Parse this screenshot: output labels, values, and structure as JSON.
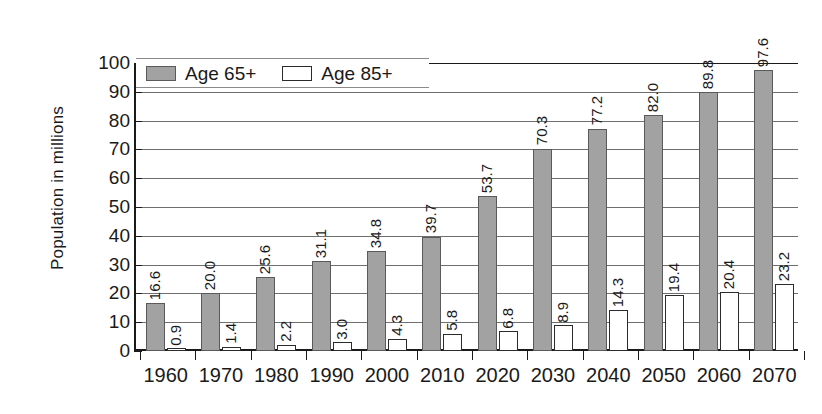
{
  "chart_data": {
    "type": "bar",
    "title": "",
    "subtitle": "",
    "xlabel": "",
    "ylabel": "Population in millions",
    "ylim": [
      0,
      100
    ],
    "yticks": [
      0,
      10,
      20,
      30,
      40,
      50,
      60,
      70,
      80,
      90,
      100
    ],
    "ytick_labels": [
      "0",
      "10",
      "20",
      "30",
      "40",
      "50",
      "60",
      "70",
      "80",
      "90",
      "100"
    ],
    "grid": true,
    "legend_position": "top-left-inside",
    "categories": [
      "1960",
      "1970",
      "1980",
      "1990",
      "2000",
      "2010",
      "2020",
      "2030",
      "2040",
      "2050",
      "2060",
      "2070"
    ],
    "series": [
      {
        "name": "Age 65+",
        "color": "#a2a2a2",
        "edge_color": "#5a5a5a",
        "values": [
          16.6,
          20.0,
          25.6,
          31.1,
          34.8,
          39.7,
          53.7,
          70.3,
          77.2,
          82.0,
          89.8,
          97.6
        ],
        "value_labels": [
          "16.6",
          "20.0",
          "25.6",
          "31.1",
          "34.8",
          "39.7",
          "53.7",
          "70.3",
          "77.2",
          "82.0",
          "89.8",
          "97.6"
        ]
      },
      {
        "name": "Age 85+",
        "color": "#ffffff",
        "edge_color": "#2b2b2b",
        "values": [
          0.9,
          1.4,
          2.2,
          3.0,
          4.3,
          5.8,
          6.8,
          8.9,
          14.3,
          19.4,
          20.4,
          23.2
        ],
        "value_labels": [
          "0.9",
          "1.4",
          "2.2",
          "3.0",
          "4.3",
          "5.8",
          "6.8",
          "8.9",
          "14.3",
          "19.4",
          "20.4",
          "23.2"
        ]
      }
    ]
  },
  "legend": {
    "items": [
      {
        "label": "Age 65+",
        "swatch": "gray"
      },
      {
        "label": "Age 85+",
        "swatch": "white"
      }
    ]
  },
  "axes": {
    "y_title": "Population in millions"
  }
}
